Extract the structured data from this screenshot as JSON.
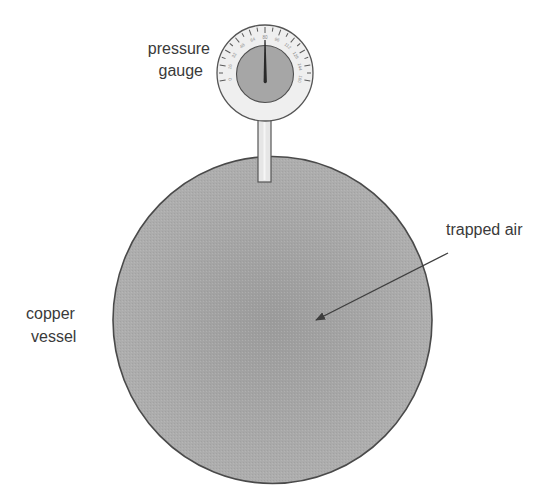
{
  "diagram": {
    "type": "labelled apparatus diagram",
    "labels": {
      "gauge_line1": "pressure",
      "gauge_line2": "gauge",
      "trapped_air": "trapped air",
      "vessel_line1": "copper",
      "vessel_line2": "vessel"
    },
    "components": [
      {
        "name": "pressure gauge",
        "shape": "dial with needle"
      },
      {
        "name": "connecting tube",
        "shape": "vertical pipe"
      },
      {
        "name": "copper vessel",
        "shape": "sphere"
      },
      {
        "name": "trapped air",
        "shape": "arrow pointing to vessel interior"
      }
    ],
    "gauge": {
      "scale": [
        "0",
        "16",
        "32",
        "48",
        "64",
        "80",
        "96",
        "112",
        "128",
        "144",
        "160"
      ],
      "needle_position": "80"
    },
    "colors": {
      "vessel_fill": "#a9a9a9",
      "vessel_outline": "#4a4a4a",
      "gauge_face": "#eeeeee",
      "gauge_inner": "#a5a5a5",
      "needle": "#2a2a2a",
      "tube": "#e4e4e4",
      "label_text": "#3a3a3a"
    }
  }
}
